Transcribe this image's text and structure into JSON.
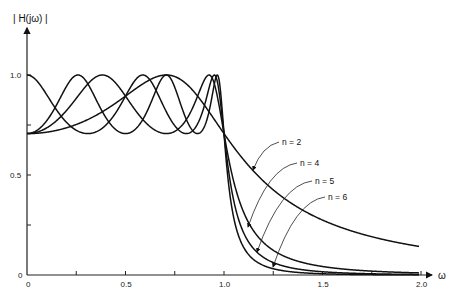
{
  "chart_data": {
    "type": "line",
    "title": "",
    "ylabel": "| H(jω) |",
    "xlabel": "ω",
    "xlim": [
      0,
      2.0
    ],
    "ylim": [
      0,
      1.0
    ],
    "grid": false,
    "x_ticks": [
      0,
      0.25,
      0.5,
      0.75,
      1.0,
      1.25,
      1.5,
      1.75,
      2.0
    ],
    "x_tick_labels": [
      {
        "value": 0,
        "label": "0"
      },
      {
        "value": 0.5,
        "label": "0.5"
      },
      {
        "value": 1.0,
        "label": "1.0"
      },
      {
        "value": 1.5,
        "label": "1.5"
      },
      {
        "value": 2.0,
        "label": "2.0"
      }
    ],
    "y_ticks": [
      0,
      0.25,
      0.5,
      0.75,
      1.0
    ],
    "y_tick_labels": [
      {
        "value": 0,
        "label": "0"
      },
      {
        "value": 0.5,
        "label": "0.5"
      },
      {
        "value": 1.0,
        "label": "1.0"
      }
    ],
    "ripple_min": 0.707,
    "series": [
      {
        "name": "n = 2",
        "order": 2,
        "label_pos": [
          282,
          145
        ],
        "arrow_to": [
          253,
          170
        ]
      },
      {
        "name": "n = 4",
        "order": 4,
        "label_pos": [
          300,
          166
        ],
        "arrow_to": [
          248,
          227
        ]
      },
      {
        "name": "n = 5",
        "order": 5,
        "label_pos": [
          315,
          184
        ],
        "arrow_to": [
          257,
          252
        ]
      },
      {
        "name": "n = 6",
        "order": 6,
        "label_pos": [
          328,
          200
        ],
        "arrow_to": [
          273,
          267
        ]
      }
    ],
    "sample_values": {
      "n=2": {
        "x": [
          0,
          0.5,
          0.707,
          1.0,
          1.25,
          1.5,
          2.0
        ],
        "y": [
          0.707,
          0.99,
          1.0,
          0.707,
          0.43,
          0.29,
          0.14
        ]
      },
      "n=4": {
        "x": [
          0,
          0.38,
          0.92,
          1.0,
          1.1,
          1.25,
          1.5,
          2.0
        ],
        "y": [
          0.707,
          1.0,
          1.0,
          0.707,
          0.27,
          0.12,
          0.04,
          0.009
        ]
      },
      "n=5": {
        "x": [
          0,
          0.31,
          0.59,
          0.81,
          0.95,
          1.0,
          1.1,
          1.25,
          1.5
        ],
        "y": [
          1.0,
          0.707,
          1.0,
          0.707,
          1.0,
          0.707,
          0.17,
          0.05,
          0.01
        ]
      },
      "n=6": {
        "x": [
          0,
          0.26,
          0.5,
          0.71,
          0.87,
          0.97,
          1.0,
          1.1,
          1.25
        ],
        "y": [
          0.707,
          1.0,
          0.707,
          1.0,
          0.707,
          1.0,
          0.707,
          0.1,
          0.02
        ]
      }
    }
  }
}
